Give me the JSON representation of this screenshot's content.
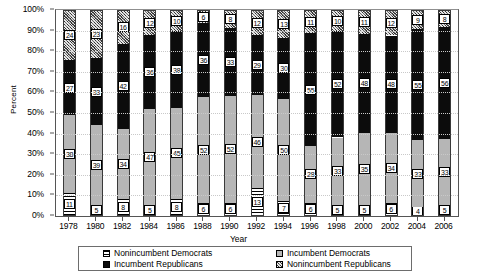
{
  "chart_data": {
    "type": "bar",
    "title": "",
    "xlabel": "Year",
    "ylabel": "Percent",
    "ylim": [
      0,
      100
    ],
    "ytick_labels": [
      "0%",
      "10%",
      "20%",
      "30%",
      "40%",
      "50%",
      "60%",
      "70%",
      "80%",
      "90%",
      "100%"
    ],
    "ytick_values": [
      0,
      10,
      20,
      30,
      40,
      50,
      60,
      70,
      80,
      90,
      100
    ],
    "grid": true,
    "stacked": true,
    "legend_position": "bottom",
    "categories": [
      "1978",
      "1980",
      "1982",
      "1984",
      "1986",
      "1988",
      "1990",
      "1992",
      "1994",
      "1996",
      "1998",
      "2000",
      "2002",
      "2004",
      "2006"
    ],
    "series": [
      {
        "name": "Nonincumbent Democrats",
        "fill": "horizontal-stripes",
        "values": [
          11,
          5,
          8,
          5,
          8,
          6,
          6,
          13,
          7,
          6,
          5,
          5,
          6,
          4,
          5
        ]
      },
      {
        "name": "Incumbent Democrats",
        "fill": "light-gray",
        "values": [
          38,
          39,
          34,
          47,
          45,
          52,
          52,
          46,
          50,
          28,
          33,
          35,
          34,
          33,
          33
        ]
      },
      {
        "name": "Incumbent Republicans",
        "fill": "black",
        "values": [
          27,
          33,
          42,
          36,
          38,
          36,
          33,
          29,
          30,
          55,
          52,
          48,
          48,
          55,
          56
        ]
      },
      {
        "name": "Nonincumbent Republicans",
        "fill": "checkered",
        "values": [
          24,
          23,
          16,
          12,
          10,
          6,
          8,
          12,
          13,
          11,
          10,
          11,
          12,
          9,
          8
        ]
      }
    ]
  },
  "legend": {
    "entries": [
      {
        "label": "Nonincumbent Democrats",
        "swatch": "horizontal-stripes"
      },
      {
        "label": "Incumbent Democrats",
        "swatch": "light-gray"
      },
      {
        "label": "Incumbent Republicans",
        "swatch": "black"
      },
      {
        "label": "Nonincumbent Republicans",
        "swatch": "checkered"
      }
    ]
  },
  "axes": {
    "y_title": "Percent",
    "x_title": "Year"
  }
}
